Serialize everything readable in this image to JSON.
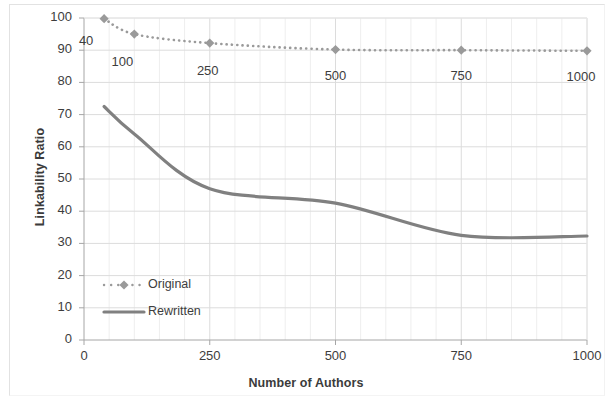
{
  "chart_data": {
    "type": "line",
    "title": "",
    "xlabel": "Number of Authors",
    "ylabel": "Linkability Ratio",
    "xlim": [
      0,
      1000
    ],
    "ylim": [
      0,
      100
    ],
    "xticks": [
      "0",
      "250",
      "500",
      "750",
      "1000"
    ],
    "xtick_values": [
      0,
      250,
      500,
      750,
      1000
    ],
    "yticks": [
      "0",
      "10",
      "20",
      "30",
      "40",
      "50",
      "60",
      "70",
      "80",
      "90",
      "100"
    ],
    "ytick_values": [
      0,
      10,
      20,
      30,
      40,
      50,
      60,
      70,
      80,
      90,
      100
    ],
    "grid": true,
    "legend_position": "inside-lower-left",
    "x": [
      40,
      100,
      250,
      500,
      750,
      1000
    ],
    "series": [
      {
        "name": "Original",
        "style": "dotted",
        "marker": "diamond",
        "color": "#9a9a9a",
        "values": [
          99.8,
          95.0,
          92.2,
          90.2,
          90.0,
          89.8
        ]
      },
      {
        "name": "Rewritten",
        "style": "solid",
        "marker": "none",
        "color": "#808080",
        "values": [
          72.5,
          64.0,
          47.0,
          42.5,
          32.5,
          32.3
        ]
      }
    ],
    "point_annotations": [
      {
        "text": "40",
        "series": "Original",
        "x": 40
      },
      {
        "text": "100",
        "series": "Original",
        "x": 100
      },
      {
        "text": "250",
        "series": "Original",
        "x": 250
      },
      {
        "text": "500",
        "series": "Original",
        "x": 500
      },
      {
        "text": "750",
        "series": "Original",
        "x": 750
      },
      {
        "text": "1000",
        "series": "Original",
        "x": 1000
      }
    ]
  },
  "legend": {
    "entries": [
      {
        "label": "Original"
      },
      {
        "label": "Rewritten"
      }
    ]
  },
  "colors": {
    "original_series": "#9a9a9a",
    "rewritten_series": "#808080",
    "gridline": "#dcdcdc",
    "minor_gridline": "#eeeeee",
    "axis": "#a6a6a6",
    "text": "#3d3d3d"
  }
}
